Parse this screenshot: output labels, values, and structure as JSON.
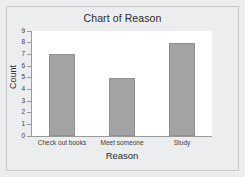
{
  "chart_data": {
    "type": "bar",
    "title": "Chart of Reason",
    "xlabel": "Reason",
    "ylabel": "Count",
    "categories": [
      "Check out books",
      "Meet someone",
      "Study"
    ],
    "values": [
      7,
      5,
      8
    ],
    "ylim": [
      0,
      9
    ],
    "yticks": [
      "9",
      "8",
      "7",
      "6",
      "5",
      "4",
      "3",
      "2",
      "1",
      "0"
    ],
    "grid": false,
    "legend": null,
    "colors": {
      "bar_fill": "#a2a3a4",
      "bar_edge": "#8e8f90",
      "plot_background": "#ffffff",
      "figure_background": "#ecedee",
      "axis": "#9a9a9a",
      "text": "#2b2b2b"
    }
  }
}
